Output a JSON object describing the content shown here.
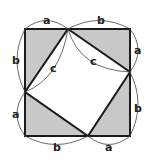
{
  "diagram": {
    "colors": {
      "fill": "#c8c8c8",
      "stroke": "#1a1a1a",
      "background": "#ffffff"
    },
    "labels": {
      "top_left": "a",
      "top_right": "b",
      "right_top": "a",
      "right_bottom": "b",
      "bottom_right": "a",
      "bottom_left": "b",
      "left_bottom": "a",
      "left_top": "b",
      "hyp_left": "c",
      "hyp_top": "c"
    }
  }
}
